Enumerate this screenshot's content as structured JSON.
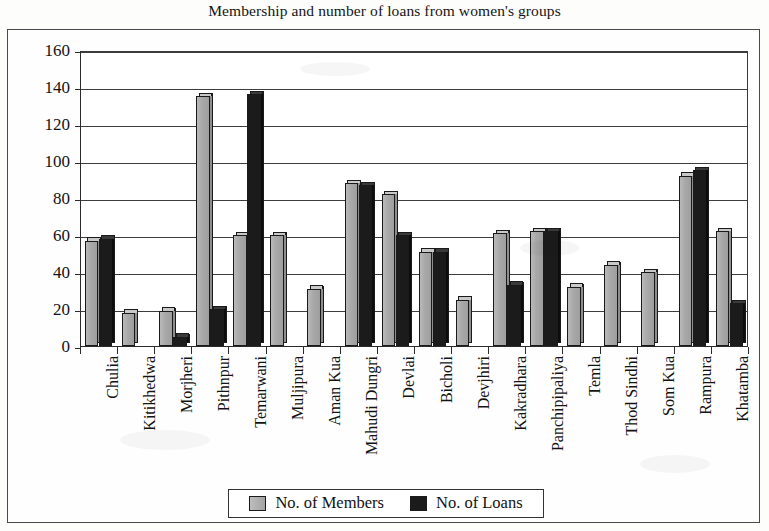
{
  "chart_data": {
    "type": "bar",
    "title": "Membership and number of loans from women's groups",
    "xlabel": "",
    "ylabel": "",
    "ylim": [
      0,
      160
    ],
    "yticks": [
      0,
      20,
      40,
      60,
      80,
      100,
      120,
      140,
      160
    ],
    "grid": true,
    "legend_position": "bottom",
    "categories": [
      "Chulia",
      "Kitikhedwa",
      "Morjheri",
      "Pithnpur",
      "Temarwani",
      "Muljipura",
      "Aman Kua",
      "Mahudi Dungri",
      "Devlai",
      "Bicholi",
      "Devjhiri",
      "Kakradhara",
      "Panchipipaliya",
      "Temla",
      "Thod Sindhi",
      "Som Kua",
      "Rampura",
      "Khatamba"
    ],
    "series": [
      {
        "name": "No. of Members",
        "color": "#a8a8a8",
        "values": [
          57,
          18,
          19,
          135,
          60,
          60,
          31,
          88,
          82,
          51,
          25,
          61,
          62,
          32,
          44,
          40,
          92,
          62
        ]
      },
      {
        "name": "No. of Loans",
        "color": "#1b1b1b",
        "values": [
          58,
          0,
          5,
          20,
          136,
          0,
          0,
          87,
          60,
          51,
          0,
          33,
          62,
          0,
          0,
          0,
          95,
          23
        ]
      }
    ]
  },
  "legend": {
    "entries": [
      {
        "label": "No. of Members"
      },
      {
        "label": "No. of Loans"
      }
    ]
  }
}
